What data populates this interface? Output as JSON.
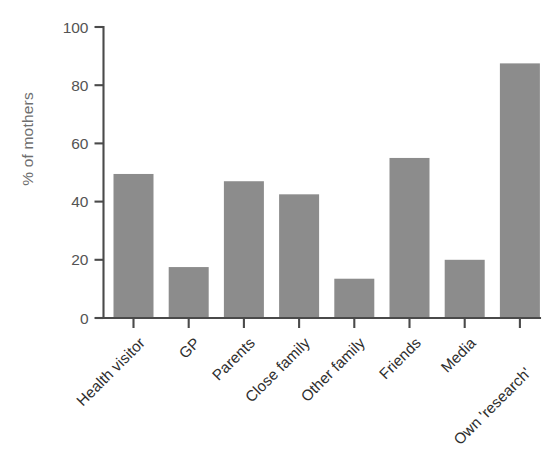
{
  "chart_data": {
    "type": "bar",
    "title": "",
    "xlabel": "",
    "ylabel": "% of mothers",
    "ylim": [
      0,
      100
    ],
    "yticks": [
      0,
      20,
      40,
      60,
      80,
      100
    ],
    "grid": false,
    "legend": null,
    "bar_color": "#8c8c8c",
    "axis_color": "#4a4a4a",
    "label_color": "#2e2e2e",
    "ylabel_color": "#6e6e6e",
    "categories": [
      "Health visitor",
      "GP",
      "Parents",
      "Close family",
      "Other family",
      "Friends",
      "Media",
      "Own 'research'"
    ],
    "values": [
      49.5,
      17.5,
      47,
      42.5,
      13.5,
      55,
      20,
      87.5
    ]
  }
}
